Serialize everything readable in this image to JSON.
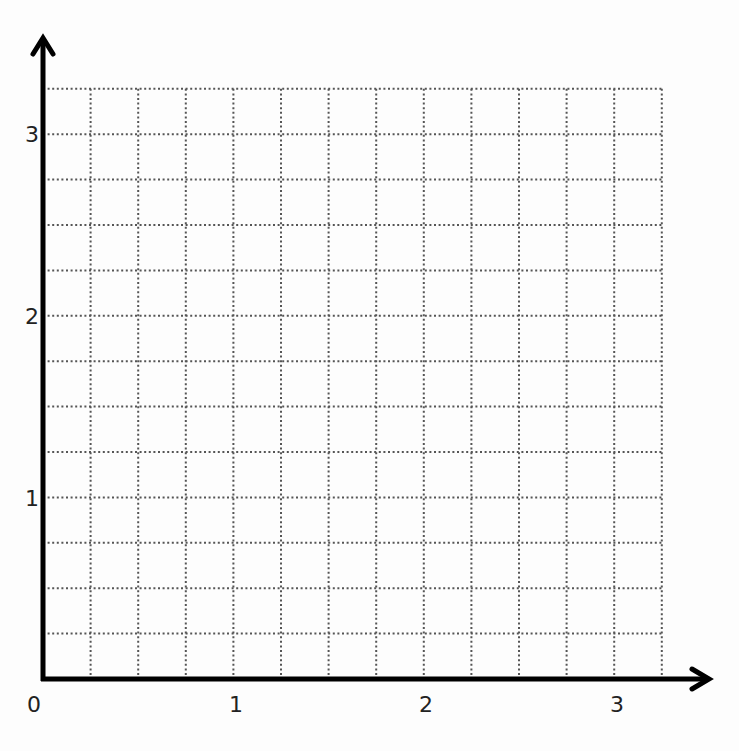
{
  "chart_data": {
    "type": "grid",
    "title": "",
    "xlabel": "",
    "ylabel": "",
    "x_ticks": [
      "0",
      "1",
      "2",
      "3"
    ],
    "y_ticks": [
      "1",
      "2",
      "3"
    ],
    "origin_label": "0",
    "xlim": [
      0,
      3.25
    ],
    "ylim": [
      0,
      3.25
    ],
    "grid": true,
    "grid_style": "dotted",
    "grid_cells_per_unit": 4,
    "grid_columns": 13,
    "grid_rows": 13,
    "series": []
  },
  "colors": {
    "axis": "#000000",
    "grid": "#555555",
    "text": "#222222",
    "background": "#fdfdfd"
  }
}
